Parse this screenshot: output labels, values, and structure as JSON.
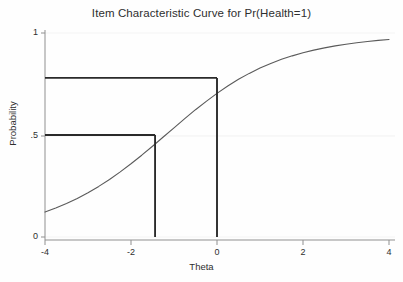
{
  "chart_data": {
    "type": "line",
    "title": "Item Characteristic Curve for Pr(Health=1)",
    "xlabel": "Theta",
    "ylabel": "Probability",
    "xlim": [
      -4,
      4
    ],
    "ylim": [
      0,
      1
    ],
    "grid": "faint-horizontal",
    "legend": null,
    "xticks": [
      -4,
      -2,
      0,
      2,
      4
    ],
    "xticklabels": [
      "-4",
      "-2",
      "0",
      "2",
      "4"
    ],
    "yticks": [
      0,
      0.5,
      1
    ],
    "yticklabels": [
      "0",
      ".5",
      "1"
    ],
    "series": [
      {
        "name": "Pr(Health=1)",
        "color": "#5a5a5a",
        "x": [
          -4.0,
          -3.75,
          -3.5,
          -3.25,
          -3.0,
          -2.75,
          -2.5,
          -2.25,
          -2.0,
          -1.75,
          -1.5,
          -1.25,
          -1.0,
          -0.75,
          -0.5,
          -0.25,
          0.0,
          0.25,
          0.5,
          0.75,
          1.0,
          1.25,
          1.5,
          1.75,
          2.0,
          2.25,
          2.5,
          2.75,
          3.0,
          3.25,
          3.5,
          3.75,
          4.0
        ],
        "y": [
          0.122,
          0.142,
          0.164,
          0.189,
          0.217,
          0.248,
          0.282,
          0.319,
          0.359,
          0.401,
          0.445,
          0.49,
          0.535,
          0.58,
          0.624,
          0.665,
          0.704,
          0.74,
          0.773,
          0.802,
          0.828,
          0.851,
          0.871,
          0.888,
          0.903,
          0.916,
          0.927,
          0.937,
          0.945,
          0.952,
          0.958,
          0.964,
          0.968
        ]
      }
    ],
    "annotations": [
      {
        "name": "reference-upper",
        "probability": 0.78,
        "theta": 0.0,
        "horizontal_from_theta": -4,
        "label": "Pr at Theta=0"
      },
      {
        "name": "reference-median",
        "probability": 0.5,
        "theta": -1.44,
        "horizontal_from_theta": -4,
        "label": "Theta at Pr=.5"
      }
    ]
  },
  "colors": {
    "curve": "#5a5a5a",
    "axis": "#8a8a8a",
    "reference": "#2a2a2a",
    "grid": "#f2f2f2",
    "background": "#fefefe",
    "text": "#2e2e2e"
  }
}
